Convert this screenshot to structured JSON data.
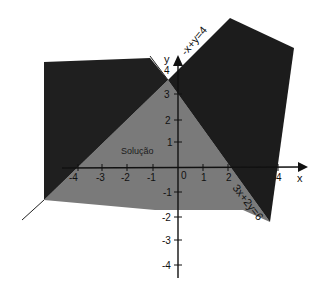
{
  "diagram": {
    "type": "linear-inequality-region",
    "colors": {
      "background": "#ffffff",
      "excluded_region": "#1e1e1e",
      "solution_region": "#7a7a7a",
      "axis": "#111111"
    },
    "axes": {
      "x_label": "x",
      "y_label": "y",
      "x_ticks": [
        "-4",
        "-3",
        "-2",
        "-1",
        "0",
        "1",
        "2",
        "4"
      ],
      "y_ticks": [
        "4",
        "3",
        "2",
        "1",
        "-1",
        "-2",
        "-3",
        "-4"
      ]
    },
    "lines": [
      {
        "id": "line1",
        "label": "-x+y=4"
      },
      {
        "id": "line2",
        "label": "3x+2y=6"
      }
    ],
    "region_label": "Solução"
  }
}
